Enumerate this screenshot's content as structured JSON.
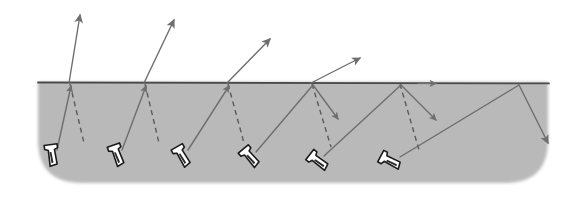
{
  "figure": {
    "background_color": "#ffffff",
    "canvas": {
      "width": 585,
      "height": 200
    }
  },
  "specimen": {
    "name": "test-block",
    "fill_color": "#b9b9b9",
    "surface_line_color": "#4a4a4a",
    "surface_y": 82,
    "bottom_y": 183,
    "left_x": 38,
    "right_x": 548,
    "corner_radius": 44,
    "edge_softness": "soft-blurred-bottom"
  },
  "style": {
    "ray_color": "#6e6e6e",
    "ray_width": 1.4,
    "normal_color": "#5a5a5a",
    "normal_width": 1.4,
    "normal_dash": "5,4",
    "probe_outline_color": "#1a1a1a",
    "probe_fill_color": "#ffffff",
    "probe_outline_width": 1.6
  },
  "probes": [
    {
      "id": "probe-1",
      "label": "probe-1",
      "body_x": 52,
      "body_y": 155,
      "rotation_deg": -8,
      "incident_from": [
        56,
        150
      ],
      "incidence_point": [
        70,
        84
      ],
      "normal_end": [
        82,
        142
      ],
      "escape_ray_end": [
        79,
        12
      ],
      "escape_arrow": true,
      "reflected_ray_end": null,
      "down_arrow_at_surface": true
    },
    {
      "id": "probe-2",
      "label": "probe-2",
      "body_x": 116,
      "body_y": 155,
      "rotation_deg": -20,
      "incident_from": [
        122,
        150
      ],
      "incidence_point": [
        145,
        84
      ],
      "normal_end": [
        157,
        142
      ],
      "escape_ray_end": [
        175,
        18
      ],
      "escape_arrow": true,
      "reflected_ray_end": null,
      "down_arrow_at_surface": true
    },
    {
      "id": "probe-3",
      "label": "probe-3",
      "body_x": 181,
      "body_y": 155,
      "rotation_deg": -30,
      "incident_from": [
        188,
        150
      ],
      "incidence_point": [
        228,
        84
      ],
      "normal_end": [
        243,
        142
      ],
      "escape_ray_end": [
        272,
        38
      ],
      "escape_arrow": true,
      "reflected_ray_end": null,
      "down_arrow_at_surface": true
    },
    {
      "id": "probe-4",
      "label": "probe-4",
      "body_x": 249,
      "body_y": 156,
      "rotation_deg": -40,
      "incident_from": [
        256,
        152
      ],
      "incidence_point": [
        312,
        84
      ],
      "normal_end": [
        330,
        143
      ],
      "escape_ray_end": [
        362,
        57
      ],
      "escape_arrow": true,
      "reflected_ray_end": [
        336,
        117
      ],
      "down_arrow_at_surface": true
    },
    {
      "id": "probe-5",
      "label": "probe-5",
      "body_x": 316,
      "body_y": 160,
      "rotation_deg": -50,
      "incident_from": [
        324,
        156
      ],
      "incidence_point": [
        400,
        84
      ],
      "normal_end": [
        418,
        148
      ],
      "escape_ray_end": null,
      "escape_arrow": false,
      "reflected_ray_end": [
        433,
        118
      ],
      "down_arrow_at_surface": false
    },
    {
      "id": "probe-6",
      "label": "probe-6",
      "body_x": 388,
      "body_y": 160,
      "rotation_deg": -62,
      "incident_from": [
        398,
        157
      ],
      "incidence_point": [
        518,
        84
      ],
      "normal_end": null,
      "escape_ray_end": null,
      "escape_arrow": false,
      "reflected_ray_end": [
        546,
        142
      ],
      "down_arrow_at_surface": false
    }
  ],
  "surface_wave": {
    "name": "creeping-surface-wave-arrow",
    "x": 430,
    "y": 83,
    "direction": "right",
    "visible": true
  },
  "annotations": {
    "escaping_rays_count": 4,
    "reflected_rays_count": 3,
    "normals_count": 5,
    "probes_count": 6
  }
}
